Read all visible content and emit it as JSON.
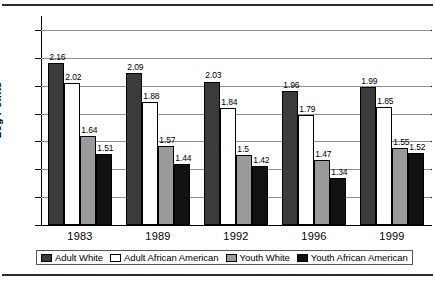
{
  "chart_data": {
    "type": "bar",
    "title": "",
    "xlabel": "",
    "ylabel": "Log Points",
    "categories": [
      "1983",
      "1989",
      "1992",
      "1996",
      "1999"
    ],
    "series": [
      {
        "name": "Adult White",
        "color": "#3b3b3b",
        "values": [
          2.16,
          2.09,
          2.03,
          1.96,
          1.99
        ],
        "labels": [
          "2.16",
          "2.09",
          "2.03",
          "1.96",
          "1.99"
        ]
      },
      {
        "name": "Adult African American",
        "color": "#ffffff",
        "values": [
          2.02,
          1.88,
          1.84,
          1.79,
          1.85
        ],
        "labels": [
          "2.02",
          "1.88",
          "1.84",
          "1.79",
          "1.85"
        ]
      },
      {
        "name": "Youth White",
        "color": "#9a9a9a",
        "values": [
          1.64,
          1.57,
          1.5,
          1.47,
          1.55
        ],
        "labels": [
          "1.64",
          "1.57",
          "1.5",
          "1.47",
          "1.55"
        ]
      },
      {
        "name": "Youth African American",
        "color": "#111111",
        "values": [
          1.51,
          1.44,
          1.42,
          1.34,
          1.52
        ],
        "labels": [
          "1.51",
          "1.44",
          "1.42",
          "1.34",
          "1.52"
        ]
      }
    ],
    "ylim": [
      1.0,
      2.5
    ],
    "yticks": [
      "1.0",
      "1.2",
      "1.4",
      "1.6",
      "1.8",
      "2.0",
      "2.2",
      "2.4"
    ],
    "ytick_values": [
      1.0,
      1.2,
      1.4,
      1.6,
      1.8,
      2.0,
      2.2,
      2.4
    ],
    "grid": true,
    "legend_position": "bottom"
  }
}
